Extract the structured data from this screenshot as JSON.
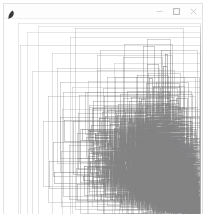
{
  "window": {
    "title": "",
    "app_icon": "feather-icon",
    "background_color": "#ffffff",
    "border_color": "#e2e2e4"
  },
  "title_bar": {
    "background_color": "#fdfdfd",
    "controls": [
      {
        "name": "minimize-button",
        "glyph": "minimize-icon",
        "label": "─"
      },
      {
        "name": "maximize-button",
        "glyph": "maximize-icon",
        "label": "□"
      },
      {
        "name": "close-button",
        "glyph": "close-icon",
        "label": "×"
      }
    ]
  },
  "canvas": {
    "name": "recursive-rectangles-canvas",
    "width": 198,
    "height": 196,
    "background_color": "#ffffff",
    "stroke_color": "#6b6b6b",
    "description": "Nested recursive rectangle outlines growing denser toward the lower right",
    "line_width": 0.5,
    "min_opacity": 0.28,
    "max_opacity": 0.85,
    "recursion_depth": 9,
    "split_ratio": 0.62,
    "seed": 20240517,
    "inset_left": 14,
    "inset_top": 4
  }
}
